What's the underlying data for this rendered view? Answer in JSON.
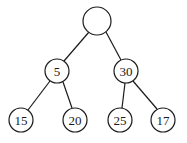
{
  "diagram": {
    "type": "binary-tree",
    "colors": {
      "stroke": "#1a1a1a",
      "fill": "#ffffff",
      "text": "#1a1a1a"
    },
    "nodes": [
      {
        "id": "root",
        "label": "",
        "cx": 97,
        "cy": 21,
        "r": 14
      },
      {
        "id": "n5",
        "label": "5",
        "cx": 57,
        "cy": 71,
        "r": 12
      },
      {
        "id": "n30",
        "label": "30",
        "cx": 126,
        "cy": 71,
        "r": 12
      },
      {
        "id": "n15",
        "label": "15",
        "cx": 21,
        "cy": 120,
        "r": 12
      },
      {
        "id": "n20",
        "label": "20",
        "cx": 75,
        "cy": 120,
        "r": 12
      },
      {
        "id": "n25",
        "label": "25",
        "cx": 120,
        "cy": 120,
        "r": 12
      },
      {
        "id": "n17",
        "label": "17",
        "cx": 163,
        "cy": 120,
        "r": 12
      }
    ],
    "edges": [
      {
        "from": "root",
        "to": "n5"
      },
      {
        "from": "root",
        "to": "n30"
      },
      {
        "from": "n5",
        "to": "n15"
      },
      {
        "from": "n5",
        "to": "n20"
      },
      {
        "from": "n30",
        "to": "n25"
      },
      {
        "from": "n30",
        "to": "n17"
      }
    ]
  }
}
